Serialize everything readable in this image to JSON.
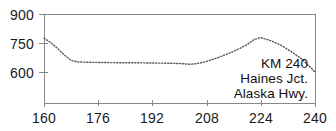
{
  "chart_data": {
    "type": "line",
    "title": "",
    "subtitle": "",
    "xlabel": "",
    "ylabel": "",
    "xlim": [
      160,
      240
    ],
    "ylim": [
      525,
      900
    ],
    "grid": false,
    "legend_position": "none",
    "line_style": "dotted",
    "line_color": "#555555",
    "axis_color": "#777777",
    "xticks": [
      160,
      176,
      192,
      208,
      224,
      240
    ],
    "yticks": [
      600,
      750,
      900
    ],
    "xtick_labels": [
      "160",
      "176",
      "192",
      "208",
      "224",
      "240"
    ],
    "ytick_labels": [
      "600",
      "750",
      "900"
    ],
    "annotations": [
      {
        "text": "KM 240"
      },
      {
        "text": "Haines Jct."
      },
      {
        "text": "Alaska Hwy."
      }
    ],
    "x": [
      160,
      162,
      164,
      166,
      168,
      170,
      174,
      178,
      182,
      186,
      190,
      194,
      198,
      201,
      203,
      205,
      208,
      211,
      214,
      217,
      220,
      222,
      224,
      227,
      230,
      233,
      236,
      238,
      240
    ],
    "values": [
      775,
      752,
      722,
      688,
      660,
      652,
      650,
      649,
      648,
      648,
      647,
      646,
      645,
      643,
      640,
      643,
      655,
      672,
      692,
      715,
      742,
      768,
      778,
      762,
      738,
      705,
      668,
      635,
      600
    ],
    "series": [
      {
        "name": "KM 240 Haines Jct. Alaska Hwy.",
        "x": [
          160,
          162,
          164,
          166,
          168,
          170,
          174,
          178,
          182,
          186,
          190,
          194,
          198,
          201,
          203,
          205,
          208,
          211,
          214,
          217,
          220,
          222,
          224,
          227,
          230,
          233,
          236,
          238,
          240
        ],
        "values": [
          775,
          752,
          722,
          688,
          660,
          652,
          650,
          649,
          648,
          648,
          647,
          646,
          645,
          643,
          640,
          643,
          655,
          672,
          692,
          715,
          742,
          768,
          778,
          762,
          738,
          705,
          668,
          635,
          600
        ]
      }
    ]
  },
  "axis": {
    "y": {
      "t900": "900",
      "t750": "750",
      "t600": "600"
    },
    "x": {
      "t160": "160",
      "t176": "176",
      "t192": "192",
      "t208": "208",
      "t224": "224",
      "t240": "240"
    }
  },
  "annotation": {
    "line1": "KM 240",
    "line2": "Haines Jct.",
    "line3": "Alaska Hwy."
  }
}
